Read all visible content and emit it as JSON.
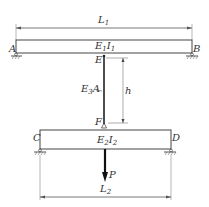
{
  "diagram": {
    "top_beam": {
      "left_support": "A",
      "right_support": "B",
      "stiffness_label": "E",
      "stiffness_sub1": "1",
      "stiffness_label2": "I",
      "stiffness_sub2": "1",
      "length_label": "L",
      "length_sub": "1",
      "connection_point": "E"
    },
    "rod": {
      "axial_label": "E",
      "axial_sub": "3",
      "axial_label2": "A",
      "height_label": "h",
      "bottom_point": "F"
    },
    "bottom_beam": {
      "left_support": "C",
      "right_support": "D",
      "stiffness_label": "E",
      "stiffness_sub1": "2",
      "stiffness_label2": "I",
      "stiffness_sub2": "2",
      "length_label": "L",
      "length_sub": "2"
    },
    "load": {
      "label": "P"
    },
    "colors": {
      "line": "#333333",
      "thin": "#555555",
      "background": "#ffffff"
    }
  }
}
